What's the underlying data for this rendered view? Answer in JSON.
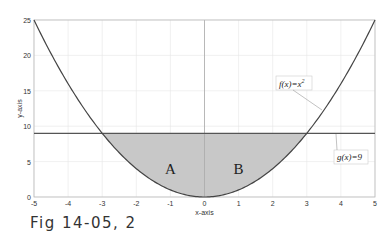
{
  "chart_data": {
    "type": "line",
    "title": "",
    "xlabel": "x-axis",
    "ylabel": "y-axis",
    "xlim": [
      -5,
      5
    ],
    "ylim": [
      0,
      25
    ],
    "grid": true,
    "x_ticks": [
      "-5",
      "-4",
      "-3",
      "-2",
      "-1",
      "0",
      "1",
      "2",
      "3",
      "4",
      "5"
    ],
    "y_ticks": [
      "0",
      "5",
      "10",
      "15",
      "20",
      "25"
    ],
    "series": [
      {
        "name": "f(x)=x^2",
        "x": [
          -5,
          -4,
          -3,
          -2,
          -1,
          0,
          1,
          2,
          3,
          4,
          5
        ],
        "values": [
          25,
          16,
          9,
          4,
          1,
          0,
          1,
          4,
          9,
          16,
          25
        ]
      },
      {
        "name": "g(x)=9",
        "x": [
          -5,
          5
        ],
        "values": [
          9,
          9
        ]
      }
    ],
    "shaded_region": {
      "between": [
        "g(x)=9",
        "f(x)=x^2"
      ],
      "x_range": [
        -3,
        3
      ],
      "color": "#c8c8c8"
    },
    "region_labels": [
      {
        "text": "A",
        "x": -1,
        "y": 4
      },
      {
        "text": "B",
        "x": 1,
        "y": 4
      }
    ],
    "annotations": [
      {
        "text": "f(x)=x",
        "sup": "2",
        "target": "f(x)=x^2"
      },
      {
        "text": "g(x)=9",
        "target": "g(x)=9"
      }
    ]
  },
  "caption": "Fig 14-05, 2"
}
